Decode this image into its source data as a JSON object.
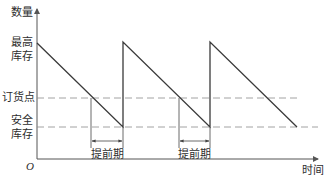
{
  "diagram": {
    "type": "inventory-sawtooth",
    "y_axis_label": "数量",
    "x_axis_label": "时间",
    "origin_label": "O",
    "levels": {
      "max_stock": {
        "label_line1": "最高",
        "label_line2": "库存"
      },
      "reorder_point": {
        "label": "订货点"
      },
      "safety_stock": {
        "label_line1": "安全",
        "label_line2": "库存"
      }
    },
    "lead_time_label": "提前期",
    "lead_time_markers": [
      {
        "label": "提前期"
      },
      {
        "label": "提前期"
      }
    ],
    "cycles": 3,
    "colors": {
      "line": "#3a3a3a",
      "dashed": "#8a8a8a",
      "axis": "#555555"
    }
  }
}
